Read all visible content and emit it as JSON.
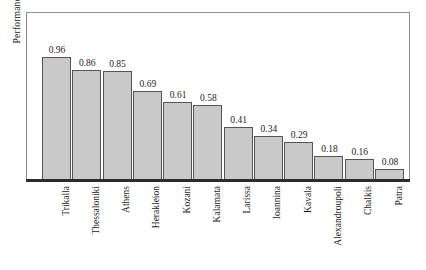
{
  "chart_data": {
    "type": "bar",
    "title": "",
    "xlabel": "",
    "ylabel": "Performance",
    "ylim": [
      0,
      1.0
    ],
    "grid": false,
    "legend": "none",
    "categories": [
      "Trikalla",
      "Thessaloniki",
      "Athens",
      "Herakleion",
      "Kozani",
      "Kalamata",
      "Larissa",
      "Ioannina",
      "Kavala",
      "Alexandroupoli",
      "Chalkis",
      "Patra"
    ],
    "values": [
      0.96,
      0.86,
      0.85,
      0.69,
      0.61,
      0.58,
      0.41,
      0.34,
      0.29,
      0.18,
      0.16,
      0.08
    ],
    "value_labels": [
      "0.96",
      "0.86",
      "0.85",
      "0.69",
      "0.61",
      "0.58",
      "0.41",
      "0.34",
      "0.29",
      "0.18",
      "0.16",
      "0.08"
    ],
    "colors": {
      "bar_fill": "#c9c9c9",
      "bar_border": "#555555",
      "axis": "#2c2c2c",
      "frame": "#8e8e8e",
      "text": "#1c1c1c",
      "background": "#ffffff"
    }
  }
}
